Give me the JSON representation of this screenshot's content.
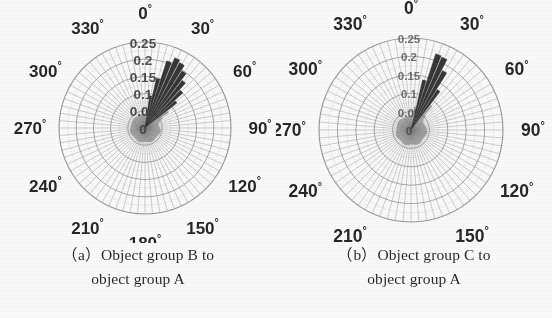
{
  "figure": {
    "type": "two-panel-polar-rose-figure",
    "background": "#ffffff",
    "panels": [
      {
        "id": "a",
        "caption_line1": "（a）Object group B to",
        "caption_line2": "object group A",
        "caption_label": "(a)",
        "caption_text": "Object group B to object group A"
      },
      {
        "id": "b",
        "caption_line1": "（b）Object group C to",
        "caption_line2": "object group A",
        "caption_label": "(b)",
        "caption_text": "Object group C to object group A"
      }
    ]
  },
  "chart_data": [
    {
      "type": "bar",
      "subtype": "polar-rose-histogram",
      "title": "",
      "panel": "a",
      "caption": "(a) Object group B to object group A",
      "xlabel": "",
      "ylabel": "",
      "angular_unit": "degree",
      "angular_direction": "clockwise",
      "angular_zero_at": "top",
      "angular_tick_labels": [
        "0°",
        "30°",
        "60°",
        "90°",
        "120°",
        "150°",
        "180°",
        "210°",
        "240°",
        "270°",
        "300°",
        "330°"
      ],
      "angular_ticks": [
        0,
        30,
        60,
        90,
        120,
        150,
        180,
        210,
        240,
        270,
        300,
        330
      ],
      "radial_tick_labels": [
        "0",
        "0.05",
        "0.1",
        "0.15",
        "0.2",
        "0.25"
      ],
      "radial_ticks": [
        0,
        0.05,
        0.1,
        0.15,
        0.2,
        0.25
      ],
      "rlim": [
        0,
        0.25
      ],
      "grid": true,
      "legend": "none",
      "bin_width_deg": 5,
      "bar_color": "#3a3a3a",
      "grid_color": "#8d8d8d",
      "categories": [
        0,
        5,
        10,
        15,
        20,
        25,
        30,
        35,
        40,
        45,
        50,
        55,
        60,
        65,
        70,
        75,
        80,
        85,
        90,
        95,
        100,
        105,
        110,
        115,
        120,
        125,
        130,
        135,
        140,
        145,
        150,
        155,
        160,
        165,
        170,
        175,
        180,
        185,
        190,
        195,
        200,
        205,
        210,
        215,
        220,
        225,
        230,
        235,
        240,
        245,
        250,
        255,
        260,
        265,
        270,
        275,
        280,
        285,
        290,
        295,
        300,
        305,
        310,
        315,
        320,
        325,
        330,
        335,
        340,
        345,
        350,
        355
      ],
      "values": [
        0.041,
        0.046,
        0.095,
        0.148,
        0.205,
        0.222,
        0.215,
        0.198,
        0.176,
        0.15,
        0.118,
        0.082,
        0.058,
        0.048,
        0.043,
        0.04,
        0.039,
        0.041,
        0.043,
        0.045,
        0.046,
        0.046,
        0.045,
        0.044,
        0.043,
        0.042,
        0.042,
        0.042,
        0.043,
        0.044,
        0.044,
        0.044,
        0.043,
        0.042,
        0.041,
        0.04,
        0.04,
        0.04,
        0.041,
        0.042,
        0.043,
        0.043,
        0.043,
        0.042,
        0.042,
        0.041,
        0.041,
        0.041,
        0.042,
        0.043,
        0.044,
        0.044,
        0.044,
        0.043,
        0.042,
        0.041,
        0.04,
        0.04,
        0.04,
        0.041,
        0.041,
        0.042,
        0.042,
        0.042,
        0.041,
        0.04,
        0.04,
        0.039,
        0.039,
        0.04,
        0.04,
        0.04
      ]
    },
    {
      "type": "bar",
      "subtype": "polar-rose-histogram",
      "title": "",
      "panel": "b",
      "caption": "(b) Object group C to object group A",
      "xlabel": "",
      "ylabel": "",
      "angular_unit": "degree",
      "angular_direction": "clockwise",
      "angular_zero_at": "top",
      "angular_tick_labels": [
        "0°",
        "30°",
        "60°",
        "90°",
        "120°",
        "150°",
        "180°",
        "210°",
        "240°",
        "270°",
        "300°",
        "330°"
      ],
      "angular_ticks": [
        0,
        30,
        60,
        90,
        120,
        150,
        180,
        210,
        240,
        270,
        300,
        330
      ],
      "radial_tick_labels": [
        "0",
        "0.05",
        "0.1",
        "0.15",
        "0.2",
        "0.25"
      ],
      "radial_ticks": [
        0,
        0.05,
        0.1,
        0.15,
        0.2,
        0.25
      ],
      "rlim": [
        0,
        0.25
      ],
      "grid": true,
      "legend": "none",
      "bin_width_deg": 5,
      "bar_color": "#3a3a3a",
      "grid_color": "#8d8d8d",
      "categories": [
        0,
        5,
        10,
        15,
        20,
        25,
        30,
        35,
        40,
        45,
        50,
        55,
        60,
        65,
        70,
        75,
        80,
        85,
        90,
        95,
        100,
        105,
        110,
        115,
        120,
        125,
        130,
        135,
        140,
        145,
        150,
        155,
        160,
        165,
        170,
        175,
        180,
        185,
        190,
        195,
        200,
        205,
        210,
        215,
        220,
        225,
        230,
        235,
        240,
        245,
        250,
        255,
        260,
        265,
        270,
        275,
        280,
        285,
        290,
        295,
        300,
        305,
        310,
        315,
        320,
        325,
        330,
        335,
        340,
        345,
        350,
        355
      ],
      "values": [
        0.038,
        0.04,
        0.064,
        0.14,
        0.218,
        0.215,
        0.183,
        0.131,
        0.086,
        0.056,
        0.044,
        0.04,
        0.038,
        0.038,
        0.039,
        0.04,
        0.041,
        0.042,
        0.043,
        0.044,
        0.044,
        0.043,
        0.042,
        0.041,
        0.04,
        0.04,
        0.04,
        0.041,
        0.042,
        0.043,
        0.043,
        0.043,
        0.042,
        0.041,
        0.04,
        0.039,
        0.039,
        0.04,
        0.041,
        0.042,
        0.043,
        0.043,
        0.042,
        0.041,
        0.04,
        0.04,
        0.04,
        0.041,
        0.042,
        0.043,
        0.043,
        0.042,
        0.041,
        0.04,
        0.04,
        0.039,
        0.039,
        0.039,
        0.04,
        0.04,
        0.041,
        0.041,
        0.041,
        0.04,
        0.039,
        0.038,
        0.038,
        0.037,
        0.037,
        0.037,
        0.038,
        0.038
      ]
    }
  ]
}
